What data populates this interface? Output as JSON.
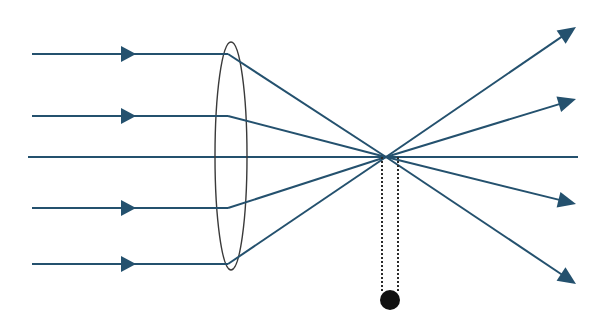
{
  "diagram": {
    "colors": {
      "ray": "#24516e",
      "lens": "#3a3a3a",
      "dotted": "#2b2b2b",
      "ball": "#111111",
      "background": "#ffffff"
    },
    "optical_axis": {
      "x1": 28,
      "x2": 578,
      "y": 157
    },
    "lens": {
      "cx": 231,
      "cy": 156,
      "rx": 16,
      "ry": 114
    },
    "focal_point": {
      "x": 386,
      "y": 157
    },
    "incoming_rays": [
      {
        "y": 54,
        "x_start": 32,
        "x_bend": 228,
        "arrow_x": 122
      },
      {
        "y": 116,
        "x_start": 32,
        "x_bend": 228,
        "arrow_x": 122
      },
      {
        "y": 208,
        "x_start": 32,
        "x_bend": 228,
        "arrow_x": 122
      },
      {
        "y": 264,
        "x_start": 32,
        "x_bend": 228,
        "arrow_x": 122
      }
    ],
    "outgoing_ray_ends": [
      {
        "x": 576,
        "y": 27
      },
      {
        "x": 576,
        "y": 99
      },
      {
        "x": 576,
        "y": 204
      },
      {
        "x": 576,
        "y": 284
      }
    ],
    "pendulum": {
      "line_left_x": 382,
      "line_right_x": 398,
      "y_top": 157,
      "y_bottom": 293,
      "ball": {
        "cx": 390,
        "cy": 300,
        "r": 10
      }
    }
  }
}
